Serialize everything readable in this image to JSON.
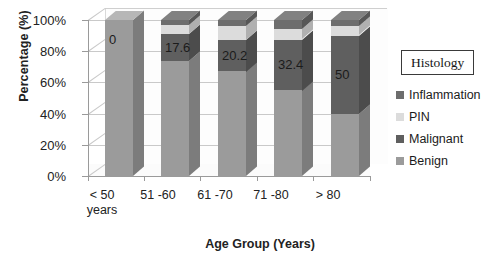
{
  "chart_data": {
    "type": "bar",
    "subtype": "stacked-column-3d-percent",
    "title": "",
    "xlabel": "Age Group (Years)",
    "ylabel": "Percentage (%)",
    "categories": [
      "< 50 years",
      "51 -60",
      "61 -70",
      "71 -80",
      "> 80"
    ],
    "category_lines": [
      [
        "< 50",
        "years"
      ],
      [
        "51 -60"
      ],
      [
        "61 -70"
      ],
      [
        "71 -80"
      ],
      [
        "> 80"
      ]
    ],
    "ylim": [
      0,
      100
    ],
    "ytick_labels": [
      "100%",
      "80%",
      "60%",
      "40%",
      "20%",
      "0%"
    ],
    "ytick_values": [
      100,
      80,
      60,
      40,
      20,
      0
    ],
    "grid": true,
    "legend_position": "right",
    "legend_title": "Histology",
    "series": [
      {
        "name": "Benign",
        "color": "#9b9b9b",
        "values": [
          100.0,
          73.5,
          67.0,
          55.0,
          40.0
        ]
      },
      {
        "name": "Malignant",
        "color": "#5f5f5f",
        "values": [
          0.0,
          17.6,
          20.2,
          32.4,
          50.0
        ]
      },
      {
        "name": "PIN",
        "color": "#dcdcdc",
        "values": [
          0.0,
          5.9,
          8.8,
          6.6,
          6.0
        ]
      },
      {
        "name": "Inflammation",
        "color": "#6d6d6d",
        "values": [
          0.0,
          3.0,
          4.0,
          6.0,
          4.0
        ]
      }
    ],
    "data_labels": [
      "0",
      "17.6",
      "20.2",
      "32.4",
      "50"
    ],
    "data_labels_series": "Malignant",
    "annotations": []
  },
  "legend": {
    "title": "Histology",
    "items": [
      {
        "label": "Inflammation",
        "color": "#6d6d6d"
      },
      {
        "label": "PIN",
        "color": "#dcdcdc"
      },
      {
        "label": "Malignant",
        "color": "#5f5f5f"
      },
      {
        "label": "Benign",
        "color": "#9b9b9b"
      }
    ]
  },
  "axes": {
    "y_title": "Percentage (%)",
    "x_title": "Age Group (Years)",
    "y_ticks": [
      "100%",
      "80%",
      "60%",
      "40%",
      "20%",
      "0%"
    ]
  },
  "colors": {
    "benign": "#9b9b9b",
    "malignant": "#5f5f5f",
    "pin": "#dcdcdc",
    "inflammation": "#6d6d6d",
    "grid": "#c9c9c9",
    "axis": "#9a9a9a",
    "text": "#1b1b1b"
  }
}
